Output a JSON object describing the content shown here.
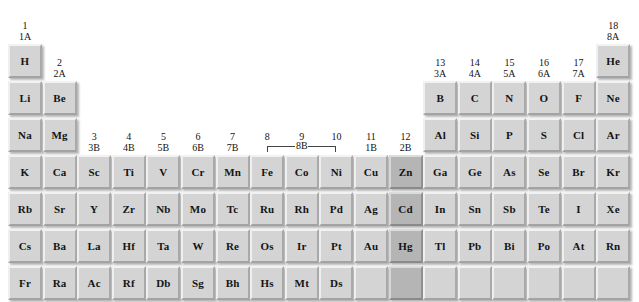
{
  "diagram": {
    "background_color": "#ffffff",
    "cell_color": "#d4d4d4",
    "highlight_color": "#b5b5b5",
    "text_color": "#141414"
  },
  "group_labels": [
    {
      "iupac": "1",
      "cas": "1A",
      "column": 1
    },
    {
      "iupac": "2",
      "cas": "2A",
      "column": 2
    },
    {
      "iupac": "3",
      "cas": "3B",
      "column": 3
    },
    {
      "iupac": "4",
      "cas": "4B",
      "column": 4
    },
    {
      "iupac": "5",
      "cas": "5B",
      "column": 5
    },
    {
      "iupac": "6",
      "cas": "6B",
      "column": 6
    },
    {
      "iupac": "7",
      "cas": "7B",
      "column": 7
    },
    {
      "iupac": "8",
      "cas": "",
      "column": 8
    },
    {
      "iupac": "9",
      "cas": "",
      "column": 9
    },
    {
      "iupac": "10",
      "cas": "",
      "column": 10
    },
    {
      "iupac": "11",
      "cas": "1B",
      "column": 11
    },
    {
      "iupac": "12",
      "cas": "2B",
      "column": 12
    },
    {
      "iupac": "13",
      "cas": "3A",
      "column": 13
    },
    {
      "iupac": "14",
      "cas": "4A",
      "column": 14
    },
    {
      "iupac": "15",
      "cas": "5A",
      "column": 15
    },
    {
      "iupac": "16",
      "cas": "6A",
      "column": 16
    },
    {
      "iupac": "17",
      "cas": "7A",
      "column": 17
    },
    {
      "iupac": "18",
      "cas": "8A",
      "column": 18
    }
  ],
  "bracket_8b": {
    "label": "8B",
    "spans_columns": [
      8,
      9,
      10
    ]
  },
  "cells": [
    {
      "sym": "H",
      "row": 1,
      "col": 1,
      "highlight": false
    },
    {
      "sym": "He",
      "row": 1,
      "col": 18,
      "highlight": false
    },
    {
      "sym": "Li",
      "row": 2,
      "col": 1,
      "highlight": false
    },
    {
      "sym": "Be",
      "row": 2,
      "col": 2,
      "highlight": false
    },
    {
      "sym": "B",
      "row": 2,
      "col": 13,
      "highlight": false
    },
    {
      "sym": "C",
      "row": 2,
      "col": 14,
      "highlight": false
    },
    {
      "sym": "N",
      "row": 2,
      "col": 15,
      "highlight": false
    },
    {
      "sym": "O",
      "row": 2,
      "col": 16,
      "highlight": false
    },
    {
      "sym": "F",
      "row": 2,
      "col": 17,
      "highlight": false
    },
    {
      "sym": "Ne",
      "row": 2,
      "col": 18,
      "highlight": false
    },
    {
      "sym": "Na",
      "row": 3,
      "col": 1,
      "highlight": false
    },
    {
      "sym": "Mg",
      "row": 3,
      "col": 2,
      "highlight": false
    },
    {
      "sym": "Al",
      "row": 3,
      "col": 13,
      "highlight": false
    },
    {
      "sym": "Si",
      "row": 3,
      "col": 14,
      "highlight": false
    },
    {
      "sym": "P",
      "row": 3,
      "col": 15,
      "highlight": false
    },
    {
      "sym": "S",
      "row": 3,
      "col": 16,
      "highlight": false
    },
    {
      "sym": "Cl",
      "row": 3,
      "col": 17,
      "highlight": false
    },
    {
      "sym": "Ar",
      "row": 3,
      "col": 18,
      "highlight": false
    },
    {
      "sym": "K",
      "row": 4,
      "col": 1,
      "highlight": false
    },
    {
      "sym": "Ca",
      "row": 4,
      "col": 2,
      "highlight": false
    },
    {
      "sym": "Sc",
      "row": 4,
      "col": 3,
      "highlight": false
    },
    {
      "sym": "Ti",
      "row": 4,
      "col": 4,
      "highlight": false
    },
    {
      "sym": "V",
      "row": 4,
      "col": 5,
      "highlight": false
    },
    {
      "sym": "Cr",
      "row": 4,
      "col": 6,
      "highlight": false
    },
    {
      "sym": "Mn",
      "row": 4,
      "col": 7,
      "highlight": false
    },
    {
      "sym": "Fe",
      "row": 4,
      "col": 8,
      "highlight": false
    },
    {
      "sym": "Co",
      "row": 4,
      "col": 9,
      "highlight": false
    },
    {
      "sym": "Ni",
      "row": 4,
      "col": 10,
      "highlight": false
    },
    {
      "sym": "Cu",
      "row": 4,
      "col": 11,
      "highlight": false
    },
    {
      "sym": "Zn",
      "row": 4,
      "col": 12,
      "highlight": true
    },
    {
      "sym": "Ga",
      "row": 4,
      "col": 13,
      "highlight": false
    },
    {
      "sym": "Ge",
      "row": 4,
      "col": 14,
      "highlight": false
    },
    {
      "sym": "As",
      "row": 4,
      "col": 15,
      "highlight": false
    },
    {
      "sym": "Se",
      "row": 4,
      "col": 16,
      "highlight": false
    },
    {
      "sym": "Br",
      "row": 4,
      "col": 17,
      "highlight": false
    },
    {
      "sym": "Kr",
      "row": 4,
      "col": 18,
      "highlight": false
    },
    {
      "sym": "Rb",
      "row": 5,
      "col": 1,
      "highlight": false
    },
    {
      "sym": "Sr",
      "row": 5,
      "col": 2,
      "highlight": false
    },
    {
      "sym": "Y",
      "row": 5,
      "col": 3,
      "highlight": false
    },
    {
      "sym": "Zr",
      "row": 5,
      "col": 4,
      "highlight": false
    },
    {
      "sym": "Nb",
      "row": 5,
      "col": 5,
      "highlight": false
    },
    {
      "sym": "Mo",
      "row": 5,
      "col": 6,
      "highlight": false
    },
    {
      "sym": "Tc",
      "row": 5,
      "col": 7,
      "highlight": false
    },
    {
      "sym": "Ru",
      "row": 5,
      "col": 8,
      "highlight": false
    },
    {
      "sym": "Rh",
      "row": 5,
      "col": 9,
      "highlight": false
    },
    {
      "sym": "Pd",
      "row": 5,
      "col": 10,
      "highlight": false
    },
    {
      "sym": "Ag",
      "row": 5,
      "col": 11,
      "highlight": false
    },
    {
      "sym": "Cd",
      "row": 5,
      "col": 12,
      "highlight": true
    },
    {
      "sym": "In",
      "row": 5,
      "col": 13,
      "highlight": false
    },
    {
      "sym": "Sn",
      "row": 5,
      "col": 14,
      "highlight": false
    },
    {
      "sym": "Sb",
      "row": 5,
      "col": 15,
      "highlight": false
    },
    {
      "sym": "Te",
      "row": 5,
      "col": 16,
      "highlight": false
    },
    {
      "sym": "I",
      "row": 5,
      "col": 17,
      "highlight": false
    },
    {
      "sym": "Xe",
      "row": 5,
      "col": 18,
      "highlight": false
    },
    {
      "sym": "Cs",
      "row": 6,
      "col": 1,
      "highlight": false
    },
    {
      "sym": "Ba",
      "row": 6,
      "col": 2,
      "highlight": false
    },
    {
      "sym": "La",
      "row": 6,
      "col": 3,
      "highlight": false
    },
    {
      "sym": "Hf",
      "row": 6,
      "col": 4,
      "highlight": false
    },
    {
      "sym": "Ta",
      "row": 6,
      "col": 5,
      "highlight": false
    },
    {
      "sym": "W",
      "row": 6,
      "col": 6,
      "highlight": false
    },
    {
      "sym": "Re",
      "row": 6,
      "col": 7,
      "highlight": false
    },
    {
      "sym": "Os",
      "row": 6,
      "col": 8,
      "highlight": false
    },
    {
      "sym": "Ir",
      "row": 6,
      "col": 9,
      "highlight": false
    },
    {
      "sym": "Pt",
      "row": 6,
      "col": 10,
      "highlight": false
    },
    {
      "sym": "Au",
      "row": 6,
      "col": 11,
      "highlight": false
    },
    {
      "sym": "Hg",
      "row": 6,
      "col": 12,
      "highlight": true
    },
    {
      "sym": "Tl",
      "row": 6,
      "col": 13,
      "highlight": false
    },
    {
      "sym": "Pb",
      "row": 6,
      "col": 14,
      "highlight": false
    },
    {
      "sym": "Bi",
      "row": 6,
      "col": 15,
      "highlight": false
    },
    {
      "sym": "Po",
      "row": 6,
      "col": 16,
      "highlight": false
    },
    {
      "sym": "At",
      "row": 6,
      "col": 17,
      "highlight": false
    },
    {
      "sym": "Rn",
      "row": 6,
      "col": 18,
      "highlight": false
    },
    {
      "sym": "Fr",
      "row": 7,
      "col": 1,
      "highlight": false
    },
    {
      "sym": "Ra",
      "row": 7,
      "col": 2,
      "highlight": false
    },
    {
      "sym": "Ac",
      "row": 7,
      "col": 3,
      "highlight": false
    },
    {
      "sym": "Rf",
      "row": 7,
      "col": 4,
      "highlight": false
    },
    {
      "sym": "Db",
      "row": 7,
      "col": 5,
      "highlight": false
    },
    {
      "sym": "Sg",
      "row": 7,
      "col": 6,
      "highlight": false
    },
    {
      "sym": "Bh",
      "row": 7,
      "col": 7,
      "highlight": false
    },
    {
      "sym": "Hs",
      "row": 7,
      "col": 8,
      "highlight": false
    },
    {
      "sym": "Mt",
      "row": 7,
      "col": 9,
      "highlight": false
    },
    {
      "sym": "Ds",
      "row": 7,
      "col": 10,
      "highlight": false
    },
    {
      "sym": "",
      "row": 7,
      "col": 11,
      "highlight": false
    },
    {
      "sym": "",
      "row": 7,
      "col": 12,
      "highlight": true
    },
    {
      "sym": "",
      "row": 7,
      "col": 13,
      "highlight": false
    },
    {
      "sym": "",
      "row": 7,
      "col": 14,
      "highlight": false
    },
    {
      "sym": "",
      "row": 7,
      "col": 15,
      "highlight": false
    },
    {
      "sym": "",
      "row": 7,
      "col": 16,
      "highlight": false
    },
    {
      "sym": "",
      "row": 7,
      "col": 17,
      "highlight": false
    },
    {
      "sym": "",
      "row": 7,
      "col": 18,
      "highlight": false
    }
  ],
  "layout": {
    "origin_x": 8,
    "origin_y": 44,
    "col_step": 34.6,
    "row_step": 37.0
  }
}
